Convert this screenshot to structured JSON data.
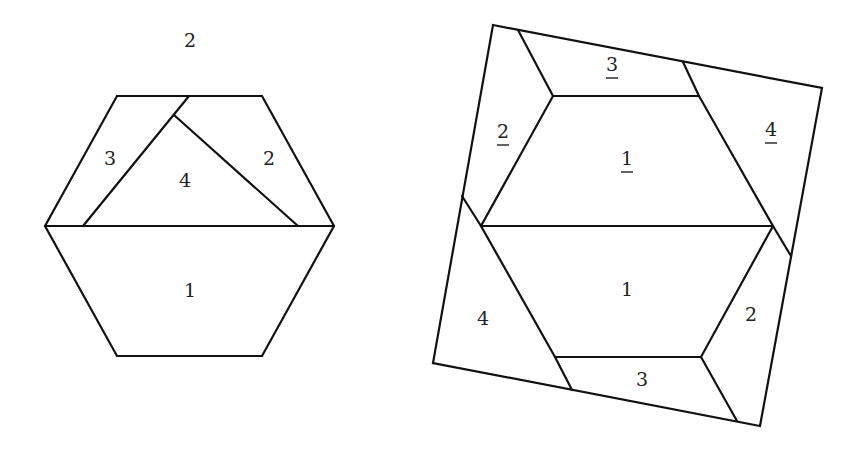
{
  "diagram": {
    "left_figure": {
      "name": "hexagon",
      "top_label": "2",
      "pieces": [
        {
          "id": "piece-1",
          "label": "1",
          "x": 190,
          "y": 292
        },
        {
          "id": "piece-2",
          "label": "2",
          "x": 269,
          "y": 160
        },
        {
          "id": "piece-3",
          "label": "3",
          "x": 110,
          "y": 160
        },
        {
          "id": "piece-4",
          "label": "4",
          "x": 185,
          "y": 182
        }
      ]
    },
    "right_figure": {
      "name": "square",
      "pieces": [
        {
          "id": "piece-1-underlined",
          "label": "1",
          "underlined": true,
          "x": 627,
          "y": 160
        },
        {
          "id": "piece-2-underlined",
          "label": "2",
          "underlined": true,
          "x": 503,
          "y": 133
        },
        {
          "id": "piece-3-underlined",
          "label": "3",
          "underlined": true,
          "x": 612,
          "y": 66
        },
        {
          "id": "piece-4-underlined",
          "label": "4",
          "underlined": true,
          "x": 771,
          "y": 131
        },
        {
          "id": "piece-1",
          "label": "1",
          "underlined": false,
          "x": 627,
          "y": 291
        },
        {
          "id": "piece-2",
          "label": "2",
          "underlined": false,
          "x": 751,
          "y": 316
        },
        {
          "id": "piece-3",
          "label": "3",
          "underlined": false,
          "x": 642,
          "y": 381
        },
        {
          "id": "piece-4",
          "label": "4",
          "underlined": false,
          "x": 483,
          "y": 320
        }
      ]
    },
    "colors": {
      "stroke": "#111111",
      "text": "#222222",
      "background": "#ffffff"
    }
  }
}
